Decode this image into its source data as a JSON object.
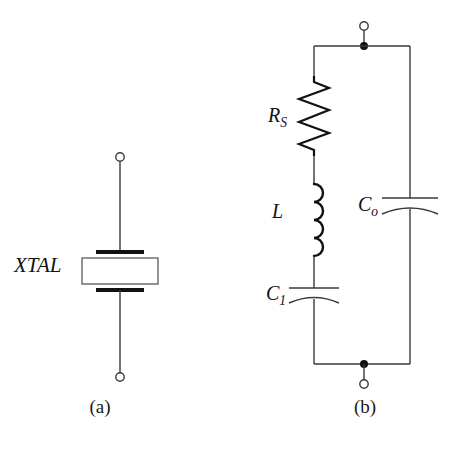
{
  "figure": {
    "background_color": "#ffffff",
    "line_color": "#1a1a1a",
    "width": 451,
    "height": 449
  },
  "panel_a": {
    "caption": "(a)",
    "component_label": "XTAL",
    "symbol": "quartz-crystal",
    "terminals": [
      "top-open-circle",
      "bottom-open-circle"
    ],
    "geometry": {
      "wire_x": 120,
      "top_terminal_y": 157,
      "bottom_terminal_y": 377,
      "top_plate_y": 252,
      "bottom_plate_y": 290,
      "plate_half_width": 24,
      "body_top": 258,
      "body_bottom": 284,
      "body_half_width": 38
    }
  },
  "panel_b": {
    "caption": "(b)",
    "description": "equivalent-circuit",
    "components": [
      {
        "name": "series-resistance",
        "label_main": "R",
        "label_sub": "S",
        "type": "resistor",
        "branch": "left"
      },
      {
        "name": "motional-inductance",
        "label_main": "L",
        "label_sub": "",
        "type": "inductor",
        "branch": "left"
      },
      {
        "name": "motional-capacitance",
        "label_main": "C",
        "label_sub": "1",
        "type": "capacitor",
        "branch": "left"
      },
      {
        "name": "shunt-capacitance",
        "label_main": "C",
        "label_sub": "o",
        "type": "capacitor",
        "branch": "right"
      }
    ],
    "terminals": [
      "top-open-circle",
      "bottom-open-circle"
    ],
    "junction_dots": 2,
    "geometry": {
      "left_branch_x": 314,
      "right_branch_x": 410,
      "terminal_x": 364,
      "top_rail_y": 46,
      "bottom_rail_y": 364,
      "top_circle_y": 26,
      "bottom_circle_y": 384,
      "resistor": {
        "y_start": 76,
        "y_end": 156,
        "amplitude": 15,
        "peaks": 7
      },
      "inductor": {
        "y_start": 184,
        "y_end": 256,
        "loops": 4,
        "radius": 9
      },
      "capacitor_c1": {
        "plate_y": 288,
        "curve_y": 299,
        "half_width": 25
      },
      "capacitor_co": {
        "plate_y": 198,
        "curve_y": 209,
        "half_width": 28
      }
    }
  },
  "labels": {
    "xtal": "XTAL",
    "rs_main": "R",
    "rs_sub": "S",
    "l_main": "L",
    "c1_main": "C",
    "c1_sub": "1",
    "co_main": "C",
    "co_sub": "o",
    "caption_a": "(a)",
    "caption_b": "(b)"
  }
}
